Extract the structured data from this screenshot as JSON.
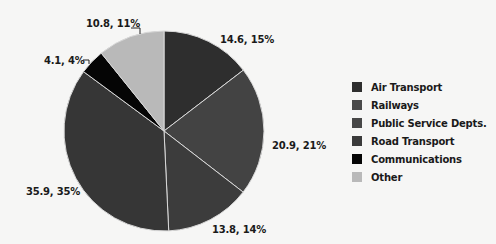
{
  "chart_data": {
    "type": "pie",
    "title": "",
    "categories": [
      "Air Transport",
      "Railways",
      "Public Service Depts.",
      "Road Transport",
      "Communications",
      "Other"
    ],
    "values": [
      14.6,
      20.9,
      13.8,
      35.9,
      4.1,
      10.8
    ],
    "percentages": [
      15,
      21,
      14,
      35,
      4,
      11
    ],
    "slice_labels": [
      "14.6, 15%",
      "20.9, 21%",
      "13.8, 14%",
      "35.9, 35%",
      "4.1, 4%",
      "10.8, 11%"
    ],
    "colors": [
      "#2e2e2e",
      "#434343",
      "#3c3c3c",
      "#363636",
      "#050505",
      "#b9b9b9"
    ],
    "start_angle_deg": 0,
    "direction": "clockwise",
    "legend_position": "right"
  },
  "legend": {
    "items": [
      {
        "label": "Air Transport",
        "color": "#2e2e2e"
      },
      {
        "label": "Railways",
        "color": "#4a4a4a"
      },
      {
        "label": "Public Service Depts.",
        "color": "#474747"
      },
      {
        "label": "Road Transport",
        "color": "#3a3a3a"
      },
      {
        "label": "Communications",
        "color": "#050505"
      },
      {
        "label": "Other",
        "color": "#b9b9b9"
      }
    ]
  }
}
